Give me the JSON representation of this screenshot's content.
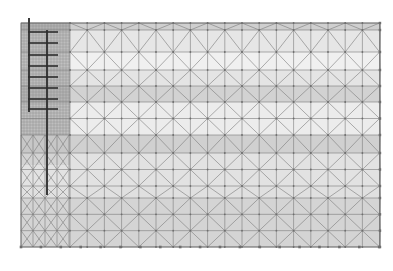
{
  "diagram": {
    "type": "finite-element-mesh",
    "domain_box": {
      "x0": 21,
      "y0": 23,
      "x1": 380,
      "y1": 247
    },
    "colors": {
      "background": "#ffffff",
      "mesh_line": "#7a7a7a",
      "node": "#6e6e6e",
      "wall": "#3a3a3a",
      "anchor": "#2e2e2e",
      "dense_zone": "#9a9a9a"
    },
    "layers": [
      {
        "name": "layer-1",
        "y_top": 23,
        "y_bottom": 30,
        "fill": "#cfcfcf"
      },
      {
        "name": "layer-2",
        "y_top": 30,
        "y_bottom": 52,
        "fill": "#e6e6e6"
      },
      {
        "name": "layer-3",
        "y_top": 52,
        "y_bottom": 70,
        "fill": "#f0f0f0"
      },
      {
        "name": "layer-4",
        "y_top": 70,
        "y_bottom": 86,
        "fill": "#e4e4e4"
      },
      {
        "name": "layer-5",
        "y_top": 86,
        "y_bottom": 102,
        "fill": "#d2d2d2"
      },
      {
        "name": "layer-6",
        "y_top": 102,
        "y_bottom": 135,
        "fill": "#ececec"
      },
      {
        "name": "layer-7",
        "y_top": 135,
        "y_bottom": 153,
        "fill": "#d0d0d0"
      },
      {
        "name": "layer-8",
        "y_top": 153,
        "y_bottom": 186,
        "fill": "#e2e2e2"
      },
      {
        "name": "layer-9",
        "y_top": 186,
        "y_bottom": 198,
        "fill": "#e0e0e0"
      },
      {
        "name": "layer-10",
        "y_top": 198,
        "y_bottom": 247,
        "fill": "#d4d4d4"
      }
    ],
    "wall": {
      "x": 46,
      "y_top": 18,
      "y_bottom": 195,
      "width": 2
    },
    "sheet_pile_left": {
      "x": 28,
      "y_top": 18,
      "y_bottom": 112,
      "width": 2
    },
    "anchors": [
      {
        "y": 32
      },
      {
        "y": 43
      },
      {
        "y": 55
      },
      {
        "y": 66
      },
      {
        "y": 77
      },
      {
        "y": 88
      },
      {
        "y": 99
      },
      {
        "y": 109
      }
    ],
    "dense_zone": {
      "x0": 21,
      "x1": 70,
      "y0": 23,
      "y1": 135
    },
    "bottom_nodes": {
      "count": 19,
      "x_start": 21,
      "x_step": 19.9,
      "y": 247
    },
    "columns": {
      "count": 19,
      "x_start": 70,
      "x_step": 17.2
    }
  }
}
